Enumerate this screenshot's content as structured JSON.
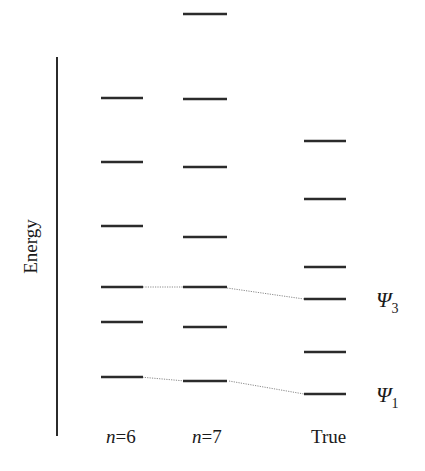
{
  "axis": {
    "label": "Energy",
    "x": 57,
    "y_top": 57,
    "y_bottom": 436
  },
  "columns": [
    {
      "id": "n6",
      "label_var": "n",
      "label_rest": "=6",
      "label_x": 106,
      "x1": 101,
      "x2": 143,
      "levels": [
        98,
        162,
        226,
        287,
        322,
        377
      ]
    },
    {
      "id": "n7",
      "label_var": "n",
      "label_rest": "=7",
      "label_x": 192,
      "x1": 183,
      "x2": 227,
      "levels": [
        14,
        99,
        167,
        237,
        287,
        327,
        381
      ]
    },
    {
      "id": "true",
      "label_var": "",
      "label_rest": "True",
      "label_x": 311,
      "x1": 304,
      "x2": 346,
      "levels": [
        141,
        199,
        267,
        299,
        352,
        394
      ]
    }
  ],
  "label_y": 443,
  "connectors": [
    {
      "from": [
        143,
        287
      ],
      "to": [
        183,
        287
      ]
    },
    {
      "from": [
        227,
        288
      ],
      "to": [
        304,
        299
      ]
    },
    {
      "from": [
        140,
        377
      ],
      "to": [
        185,
        381
      ]
    },
    {
      "from": [
        229,
        381
      ],
      "to": [
        304,
        394
      ]
    }
  ],
  "state_labels": [
    {
      "symbol": "Ψ",
      "subscript": "3",
      "x": 376,
      "y": 307
    },
    {
      "symbol": "Ψ",
      "subscript": "1",
      "x": 376,
      "y": 402
    }
  ],
  "colors": {
    "line": "#2b2b2b",
    "connector": "#8a8a8a",
    "background": "#ffffff"
  }
}
